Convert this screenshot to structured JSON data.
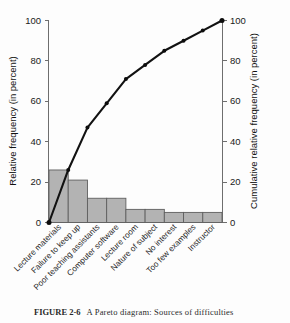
{
  "figure": {
    "caption_number": "FIGURE 2-6",
    "caption_text": "A Pareto diagram: Sources of difficulties"
  },
  "chart_data": {
    "type": "bar",
    "title": "",
    "xlabel": "",
    "ylabel": "Relative frequency (in percent)",
    "y2label": "Cumulative relative frequency (in percent)",
    "ylim": [
      0,
      100
    ],
    "y2lim": [
      0,
      100
    ],
    "yticks": [
      0,
      20,
      40,
      60,
      80,
      100
    ],
    "y2ticks": [
      0,
      20,
      40,
      60,
      80,
      100
    ],
    "ytick_labels": [
      "0",
      "20",
      "40",
      "60",
      "80",
      "100"
    ],
    "y2tick_labels": [
      "0",
      "20",
      "40",
      "60",
      "80",
      "100"
    ],
    "grid": false,
    "legend": "none",
    "categories": [
      "Lecture materials",
      "Failure to keep up",
      "Poor teaching assistants",
      "Computer software",
      "Lecture room",
      "Nature of subject",
      "No interest",
      "Too few examples",
      "Instructor"
    ],
    "series": [
      {
        "name": "Relative frequency",
        "type": "bar",
        "values": [
          26,
          21,
          12,
          12,
          6.5,
          6.5,
          5,
          5,
          5
        ]
      },
      {
        "name": "Cumulative relative frequency",
        "type": "line",
        "values": [
          26,
          47,
          59,
          71,
          78,
          85,
          90,
          95,
          100
        ],
        "origin_value": 0
      }
    ]
  }
}
